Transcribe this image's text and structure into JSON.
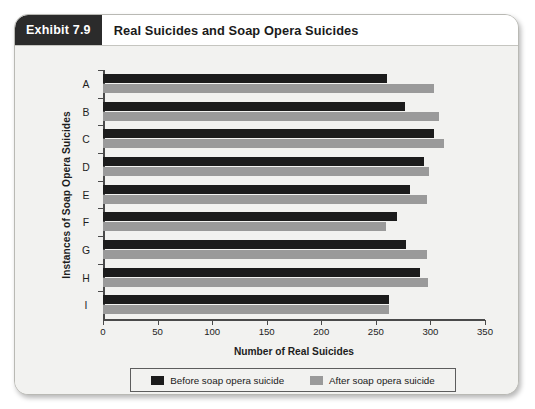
{
  "exhibit": {
    "tag": "Exhibit 7.9",
    "title": "Real Suicides and Soap Opera Suicides"
  },
  "colors": {
    "before": "#1c1c1c",
    "after": "#9a9a9a",
    "card_background": "#f2f2f0",
    "header_background": "#ffffff",
    "tag_background": "#2b2b2b",
    "axis": "#4a4a4a"
  },
  "legend": {
    "position": "bottom",
    "items": [
      {
        "label": "Before soap opera suicide",
        "color": "#1c1c1c"
      },
      {
        "label": "After soap opera suicide",
        "color": "#9a9a9a"
      }
    ]
  },
  "chart_data": {
    "type": "bar",
    "orientation": "horizontal",
    "title": "Real Suicides and Soap Opera Suicides",
    "xlabel": "Number of Real Suicides",
    "ylabel": "Instances of Soap Opera Suicides",
    "categories": [
      "A",
      "B",
      "C",
      "D",
      "E",
      "F",
      "G",
      "H",
      "I"
    ],
    "series": [
      {
        "name": "Before soap opera suicide",
        "color": "#1c1c1c",
        "values": [
          260,
          277,
          303,
          294,
          281,
          269,
          278,
          290,
          262
        ]
      },
      {
        "name": "After soap opera suicide",
        "color": "#9a9a9a",
        "values": [
          303,
          308,
          312,
          299,
          297,
          259,
          297,
          298,
          262
        ]
      }
    ],
    "xlim": [
      0,
      350
    ],
    "xticks": [
      0,
      50,
      100,
      150,
      200,
      250,
      300,
      350
    ],
    "xtick_labels": [
      "0",
      "50",
      "100",
      "150",
      "200",
      "250",
      "300",
      "350"
    ],
    "grid": false,
    "legend_position": "bottom"
  }
}
